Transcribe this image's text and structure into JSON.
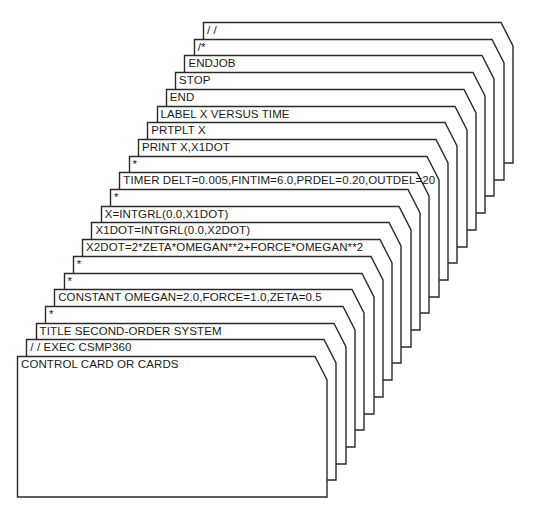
{
  "figure": {
    "line_color": "#2a2a2a",
    "card_fill": "#ffffff",
    "cards_back_to_front": [
      {
        "label": "/ /"
      },
      {
        "label": "/*"
      },
      {
        "label": "ENDJOB"
      },
      {
        "label": "STOP"
      },
      {
        "label": "END"
      },
      {
        "label": "LABEL X VERSUS TIME"
      },
      {
        "label": "PRTPLT X"
      },
      {
        "label": "PRINT X,X1DOT"
      },
      {
        "label": "*"
      },
      {
        "label": "TIMER DELT=0.005,FINTIM=6.0,PRDEL=0.20,OUTDEL=20"
      },
      {
        "label": "*"
      },
      {
        "label": "X=INTGRL(0.0,X1DOT)"
      },
      {
        "label": "X1DOT=INTGRL(0.0,X2DOT)"
      },
      {
        "label": "X2DOT=2*ZETA*OMEGAN**2+FORCE*OMEGAN**2"
      },
      {
        "label": "*"
      },
      {
        "label": "*"
      },
      {
        "label": "CONSTANT OMEGAN=2.0,FORCE=1.0,ZETA=0.5"
      },
      {
        "label": "*"
      },
      {
        "label": "TITLE SECOND-ORDER SYSTEM"
      },
      {
        "label": "/ / EXEC CSMP360"
      },
      {
        "label": "CONTROL CARD OR CARDS"
      }
    ]
  }
}
